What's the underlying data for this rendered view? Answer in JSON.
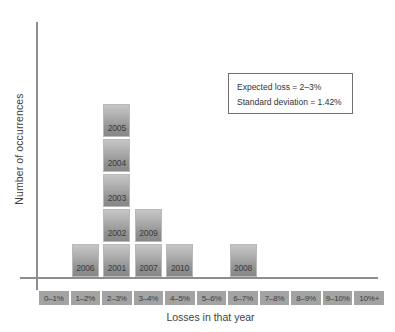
{
  "chart_data": {
    "type": "bar",
    "title": "",
    "subtitle": "",
    "xlabel": "Losses in that year",
    "ylabel": "Number of occurrences",
    "grid": false,
    "legend_position": "none",
    "stacked": true,
    "axis_ticks_shown": false,
    "categories": [
      "0–1%",
      "1–2%",
      "2–3%",
      "3–4%",
      "4–5%",
      "5–6%",
      "6–7%",
      "7–8%",
      "8–9%",
      "9–10%",
      "10%+"
    ],
    "values": [
      0,
      1,
      5,
      2,
      1,
      0,
      1,
      0,
      0,
      0,
      0
    ],
    "ylim": [
      0,
      7
    ],
    "bar_labels": [
      [],
      [
        "2006"
      ],
      [
        "2001",
        "2002",
        "2003",
        "2004",
        "2005"
      ],
      [
        "2007",
        "2009"
      ],
      [
        "2010"
      ],
      [],
      [
        "2008"
      ],
      [],
      [],
      [],
      []
    ],
    "annotations": [
      "Expected loss = 2–3%",
      "Standard deviation = 1.42%"
    ]
  },
  "annotation_box": {
    "line1": "Expected loss = 2–3%",
    "line2": "Standard deviation = 1.42%"
  },
  "axes": {
    "x_title": "Losses in that year",
    "y_title": "Number of occurrences"
  },
  "colors": {
    "bar_light": "#c6c6c6",
    "bar_dark": "#888888",
    "bar_border": "#b9b9b9",
    "tick_chip": "#a3a3a3",
    "axis_line": "#8e8e8e",
    "text": "#3a3a3a",
    "background": "#ffffff",
    "annotation_border": "#6f6f6f"
  }
}
